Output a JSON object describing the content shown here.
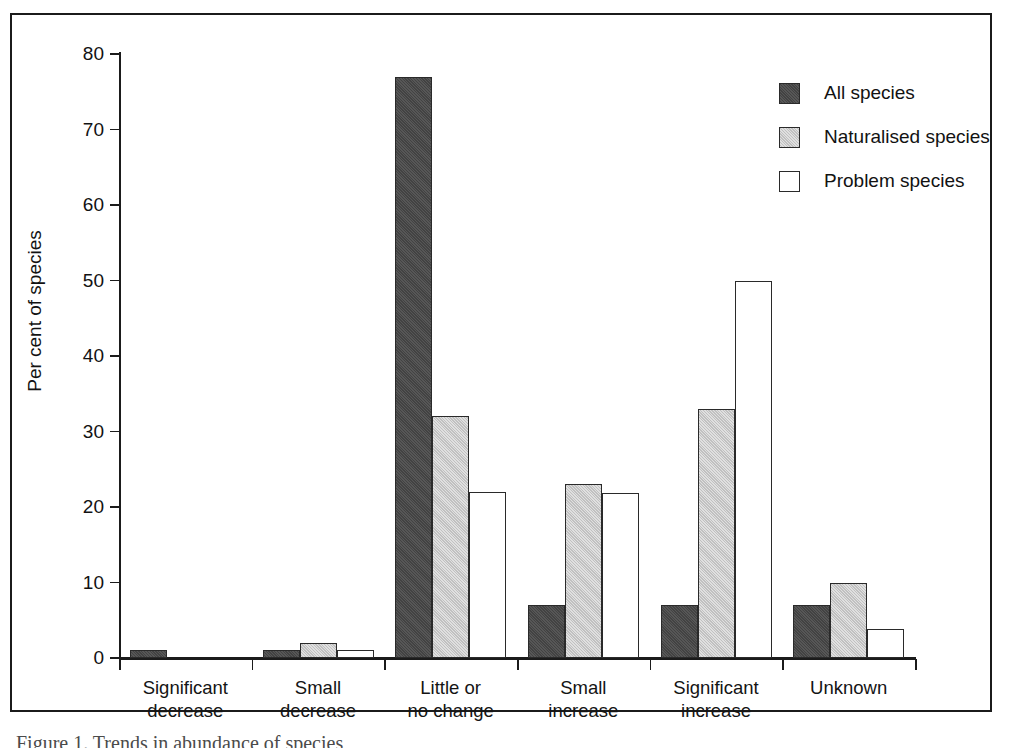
{
  "figure": {
    "frame_border_color": "#1b1b1b",
    "background": "#ffffff",
    "caption_sliver": "Figure 1. Trends in abundance of species"
  },
  "chart_data": {
    "type": "bar",
    "title": "",
    "xlabel": "",
    "ylabel": "Per cent of species",
    "ylim": [
      0,
      80
    ],
    "yticks": [
      0,
      10,
      20,
      30,
      40,
      50,
      60,
      70,
      80
    ],
    "ytick_labels": [
      "0",
      "10",
      "20",
      "30",
      "40",
      "50",
      "60",
      "70",
      "80"
    ],
    "grid": false,
    "legend_position": "top-right",
    "categories": [
      "Significant\ndecrease",
      "Small\ndecrease",
      "Little or\nno change",
      "Small\nincrease",
      "Significant\nincrease",
      "Unknown"
    ],
    "category_lines": [
      [
        "Significant",
        "decrease"
      ],
      [
        "Small",
        "decrease"
      ],
      [
        "Little or",
        "no change"
      ],
      [
        "Small",
        "increase"
      ],
      [
        "Significant",
        "increase"
      ],
      [
        "Unknown",
        ""
      ]
    ],
    "series": [
      {
        "name": "All species",
        "key": "all",
        "color": "#4a4a4a",
        "values": [
          1,
          1,
          77,
          7,
          7,
          7
        ]
      },
      {
        "name": "Naturalised species",
        "key": "naturalised",
        "color": "#cfcfcf",
        "values": [
          0,
          2,
          32,
          23,
          33,
          10
        ]
      },
      {
        "name": "Problem species",
        "key": "problem",
        "color": "#ffffff",
        "values": [
          0,
          1,
          22,
          21.8,
          50,
          3.8
        ]
      }
    ]
  },
  "legend": {
    "items": [
      {
        "label": "All species",
        "key": "all"
      },
      {
        "label": "Naturalised species",
        "key": "naturalised"
      },
      {
        "label": "Problem species",
        "key": "problem"
      }
    ]
  }
}
